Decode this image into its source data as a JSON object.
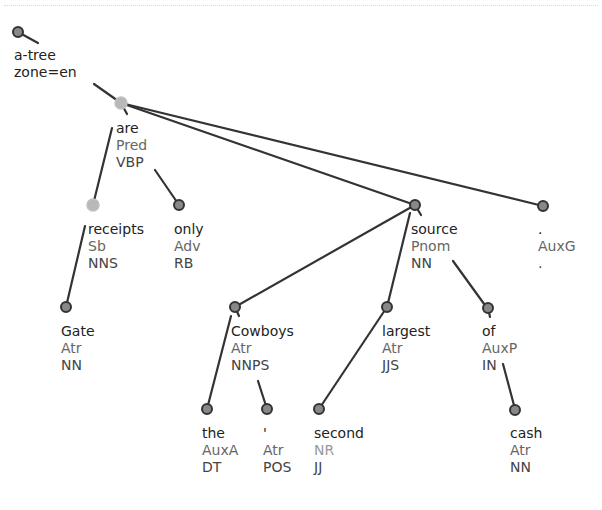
{
  "diagram": {
    "type": "dependency-tree",
    "colors": {
      "edge": "#333333",
      "node_fill": "#888888",
      "node_stroke": "#333333",
      "node_highlight_fill": "#b8b8b8",
      "form_text": "#222222",
      "afun_text": "#666666",
      "tag_text": "#444444"
    },
    "root": {
      "line1": "a-tree",
      "line2": "zone=en"
    },
    "nodes": [
      {
        "id": "are",
        "form": "are",
        "afun": "Pred",
        "tag": "VBP",
        "parent": "root",
        "highlight": true
      },
      {
        "id": "receipts",
        "form": "receipts",
        "afun": "Sb",
        "tag": "NNS",
        "parent": "are",
        "highlight": true
      },
      {
        "id": "only",
        "form": "only",
        "afun": "Adv",
        "tag": "RB",
        "parent": "are"
      },
      {
        "id": "source",
        "form": "source",
        "afun": "Pnom",
        "tag": "NN",
        "parent": "are"
      },
      {
        "id": "period",
        "form": ".",
        "afun": "AuxG",
        "tag": ".",
        "parent": "are"
      },
      {
        "id": "gate",
        "form": "Gate",
        "afun": "Atr",
        "tag": "NN",
        "parent": "receipts"
      },
      {
        "id": "cowboys",
        "form": "Cowboys",
        "afun": "Atr",
        "tag": "NNPS",
        "parent": "source"
      },
      {
        "id": "largest",
        "form": "largest",
        "afun": "Atr",
        "tag": "JJS",
        "parent": "source"
      },
      {
        "id": "of",
        "form": "of",
        "afun": "AuxP",
        "tag": "IN",
        "parent": "source"
      },
      {
        "id": "the",
        "form": "the",
        "afun": "AuxA",
        "tag": "DT",
        "parent": "cowboys"
      },
      {
        "id": "apos",
        "form": "'",
        "afun": "Atr",
        "tag": "POS",
        "parent": "cowboys"
      },
      {
        "id": "second",
        "form": "second",
        "afun": "NR",
        "tag": "JJ",
        "parent": "largest"
      },
      {
        "id": "cash",
        "form": "cash",
        "afun": "Atr",
        "tag": "NN",
        "parent": "of"
      }
    ]
  }
}
